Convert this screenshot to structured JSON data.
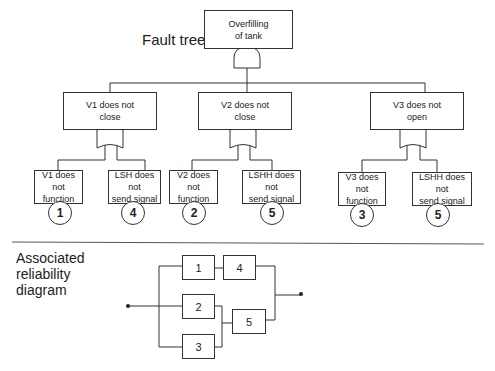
{
  "fault_tree": {
    "title": "Fault tree",
    "top_event": "Overfilling\nof tank",
    "top_gate": "AND",
    "branches": [
      {
        "event": "V1 does not\nclose",
        "gate": "OR",
        "children": [
          {
            "event": "V1 does not\nfunction",
            "id": "1"
          },
          {
            "event": "LSH does not\nsend signal",
            "id": "4"
          }
        ]
      },
      {
        "event": "V2 does not\nclose",
        "gate": "OR",
        "children": [
          {
            "event": "V2 does not\nfunction",
            "id": "2"
          },
          {
            "event": "LSHH does not\nsend signal",
            "id": "5"
          }
        ]
      },
      {
        "event": "V3 does not\nopen",
        "gate": "OR",
        "children": [
          {
            "event": "V3 does not\nfunction",
            "id": "3"
          },
          {
            "event": "LSHH does not\nsend signal",
            "id": "5"
          }
        ]
      }
    ]
  },
  "reliability_diagram": {
    "title": "Associated\nreliability\ndiagram",
    "blocks": [
      "1",
      "4",
      "2",
      "5",
      "3"
    ]
  }
}
